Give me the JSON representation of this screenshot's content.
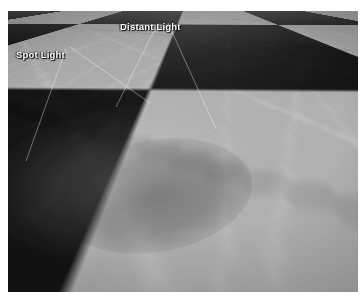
{
  "page": {
    "background_color": "#ffffff",
    "width": 364,
    "height": 299
  },
  "render": {
    "name": "checkerboard-marble-floor-lighting-render",
    "type": "3d-perspective-render",
    "x": 8,
    "y": 11,
    "width": 350,
    "height": 281,
    "description": "Perspective view of an infinite checkerboard marble floor receding to a horizon at the top of the frame",
    "floor": {
      "pattern": "checkerboard",
      "light_tile_color": "#b0b0b0",
      "dark_tile_color": "#151515",
      "material": "marble",
      "has_grout_seams": true,
      "has_veining": true
    },
    "horizon": {
      "position": "top-edge",
      "haze_color": "#787878"
    }
  },
  "annotations": {
    "leader_line_color": "#ffffff",
    "labels": [
      {
        "id": "distant-light",
        "text": "Distant Light",
        "color": "#ffffff",
        "x": 112,
        "y": 10
      },
      {
        "id": "spot-light",
        "text": "Spot Light",
        "color": "#ffffff",
        "x": 8,
        "y": 38
      }
    ]
  },
  "lighting": {
    "spot_pool_color": "#ffffff",
    "shadow_color": "#000000"
  }
}
